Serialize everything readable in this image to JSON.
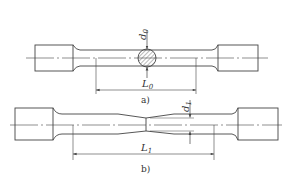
{
  "figure": {
    "line_color": "#444444",
    "panel_a": {
      "caption": "a)",
      "diameter_label": "d",
      "diameter_subscript": "0",
      "length_label": "L",
      "length_subscript": "0"
    },
    "panel_b": {
      "caption": "b)",
      "diameter_label": "d",
      "diameter_subscript": "1",
      "length_label": "L",
      "length_subscript": "1"
    }
  }
}
